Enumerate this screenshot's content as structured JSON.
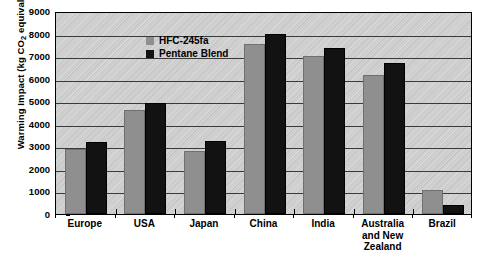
{
  "chart_data": {
    "type": "bar",
    "title": "",
    "subtitle": "",
    "xlabel": "",
    "ylabel": "Warming Impact (kg CO2 equivalent)",
    "ylabel_parts": {
      "pre": "Warming Impact (kg CO",
      "sub": "2",
      "post": " equivalent)"
    },
    "categories": [
      "Europe",
      "USA",
      "Japan",
      "China",
      "India",
      "Australia and New Zealand",
      "Brazil"
    ],
    "category_lines": [
      [
        "Europe"
      ],
      [
        "USA"
      ],
      [
        "Japan"
      ],
      [
        "China"
      ],
      [
        "India"
      ],
      [
        "Australia",
        "and New",
        "Zealand"
      ],
      [
        "Brazil"
      ]
    ],
    "series": [
      {
        "name": "HFC-245fa",
        "color": "#8f8f8f",
        "values": [
          2900,
          4600,
          2800,
          7550,
          7000,
          6150,
          1050
        ]
      },
      {
        "name": "Pentane Blend",
        "color": "#121212",
        "values": [
          3200,
          4900,
          3250,
          8000,
          7350,
          6700,
          400
        ]
      }
    ],
    "ylim": [
      0,
      9000
    ],
    "ytick_step": 1000,
    "yticks": [
      0,
      1000,
      2000,
      3000,
      4000,
      5000,
      6000,
      7000,
      8000,
      9000
    ],
    "ytick_labels": [
      "0",
      "1000",
      "2000",
      "3000",
      "4000",
      "5000",
      "6000",
      "7000",
      "8000",
      "9000"
    ],
    "grid": true,
    "grid_axis": "y",
    "legend_position": "top-left-inside",
    "plot_background": "#d0d0d0",
    "legend_entries": [
      {
        "label": "HFC-245fa",
        "color": "#8f8f8f"
      },
      {
        "label": "Pentane Blend",
        "color": "#121212"
      }
    ]
  }
}
